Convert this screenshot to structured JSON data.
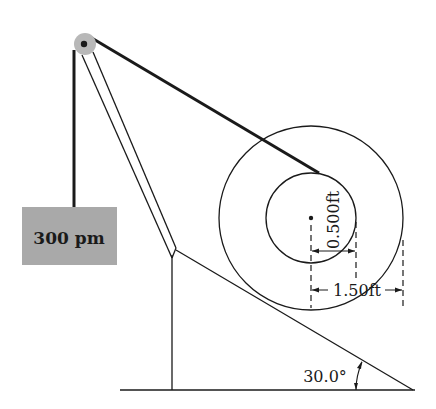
{
  "diagram": {
    "weight_label": "300 pm",
    "inner_radius_label": "0.500ft",
    "outer_radius_label": "1.50ft",
    "angle_label": "30.0°",
    "colors": {
      "line": "#1a1a1a",
      "weight_fill": "#a9a9a9",
      "pulley_fill": "#b8b8b8",
      "background": "#ffffff"
    },
    "components": [
      "pulley",
      "vertical-rope",
      "hanging-weight",
      "boom",
      "support-post",
      "inclined-plane",
      "ground",
      "spool-outer-circle",
      "spool-inner-circle",
      "spool-center",
      "cable-to-spool"
    ]
  }
}
